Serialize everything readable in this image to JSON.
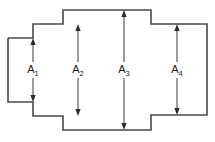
{
  "figure": {
    "name": "stepped-cross-section",
    "canvas": {
      "width": 215,
      "height": 142
    },
    "background_color": "#ffffff",
    "outline_color": "#4a4a4a",
    "dimension_color": "#4a4a4a",
    "arrow_color": "#2b2b2b",
    "label_color": "#1a1a1a",
    "outline_points": "8,38 33,38 33,24 63,24 63,10 151,10 151,24 207,24 207,115 151,115 151,130 63,130 63,116 33,116 33,102 8,102 8,38"
  },
  "dimensions": [
    {
      "id": "A1",
      "label": "A",
      "subscript": "1",
      "x": 33,
      "top_y": 38,
      "bottom_y": 102,
      "label_y": 70
    },
    {
      "id": "A2",
      "label": "A",
      "subscript": "2",
      "x": 78,
      "top_y": 24,
      "bottom_y": 116,
      "label_y": 70
    },
    {
      "id": "A3",
      "label": "A",
      "subscript": "3",
      "x": 124,
      "top_y": 10,
      "bottom_y": 130,
      "label_y": 70
    },
    {
      "id": "A4",
      "label": "A",
      "subscript": "4",
      "x": 177,
      "top_y": 24,
      "bottom_y": 115,
      "label_y": 70
    }
  ]
}
